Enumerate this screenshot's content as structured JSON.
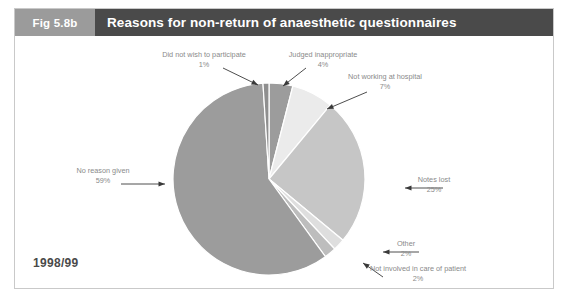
{
  "figure": {
    "number_label": "Fig 5.8b",
    "title": "Reasons for non-return of anaesthetic questionnaires",
    "year_label": "1998/99"
  },
  "chart_data": {
    "type": "pie",
    "title": "Reasons for non-return of anaesthetic questionnaires",
    "subtitle": "1998/99",
    "xlabel": "",
    "ylabel": "",
    "legend_position": "none (direct callout labels with arrows)",
    "grid": false,
    "start_angle_deg": 0,
    "direction": "clockwise",
    "categories": [
      "Judged inappropriate",
      "Not working at hospital",
      "Notes lost",
      "Other",
      "Not involved in care of patient",
      "No reason given",
      "Did not wish to participate"
    ],
    "values": [
      4,
      7,
      25,
      2,
      2,
      59,
      1
    ],
    "value_labels": [
      "4%",
      "7%",
      "25%",
      "2%",
      "2%",
      "59%",
      "1%"
    ],
    "colors": [
      "#9c9c9c",
      "#ebebeb",
      "#c6c6c6",
      "#dedede",
      "#bdbdbd",
      "#9c9c9c",
      "#8f8f8f"
    ],
    "slices": [
      {
        "label": "Judged inappropriate",
        "value": 4,
        "pct_text": "4%",
        "color": "#9c9c9c"
      },
      {
        "label": "Not working at hospital",
        "value": 7,
        "pct_text": "7%",
        "color": "#ebebeb"
      },
      {
        "label": "Notes lost",
        "value": 25,
        "pct_text": "25%",
        "color": "#c6c6c6"
      },
      {
        "label": "Other",
        "value": 2,
        "pct_text": "2%",
        "color": "#dedede"
      },
      {
        "label": "Not involved in care of patient",
        "value": 2,
        "pct_text": "2%",
        "color": "#bdbdbd"
      },
      {
        "label": "No reason given",
        "value": 59,
        "pct_text": "59%",
        "color": "#9c9c9c"
      },
      {
        "label": "Did not wish to participate",
        "value": 1,
        "pct_text": "1%",
        "color": "#8f8f8f"
      }
    ],
    "total": 100
  },
  "callouts": {
    "did_not_wish": {
      "name": "Did not wish to participate",
      "pct": "1%"
    },
    "judged_inappropriate": {
      "name": "Judged inappropriate",
      "pct": "4%"
    },
    "not_working": {
      "name": "Not working at hospital",
      "pct": "7%"
    },
    "notes_lost": {
      "name": "Notes lost",
      "pct": "25%"
    },
    "other": {
      "name": "Other",
      "pct": "2%"
    },
    "not_involved": {
      "name": "Not involved in care of patient",
      "pct": "2%"
    },
    "no_reason": {
      "name": "No reason given",
      "pct": "59%"
    }
  },
  "colors": {
    "fig_number_bg": "#9b9b9b",
    "title_bg": "#4a4a4a",
    "header_text": "#ffffff",
    "border": "#c9c9c9",
    "label_text": "#8a8a8a",
    "arrow": "#3a3a3a",
    "year_text": "#4a4a4a"
  }
}
